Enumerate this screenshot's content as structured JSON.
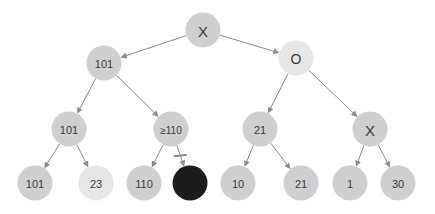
{
  "diagram": {
    "type": "game-tree",
    "edge_color": "#8a8a8a",
    "colors": {
      "default": "#cfcfcf",
      "light": "#e6e6e6",
      "pruned": "#1c1c1c"
    },
    "nodes": [
      {
        "id": "root",
        "label": "X",
        "x": 203,
        "y": 30,
        "fill": "default",
        "fs": 15
      },
      {
        "id": "n1",
        "label": "101",
        "x": 104,
        "y": 63,
        "fill": "default",
        "fs": 11
      },
      {
        "id": "n2",
        "label": "O",
        "x": 296,
        "y": 58,
        "fill": "light",
        "fs": 14
      },
      {
        "id": "n3",
        "label": "101",
        "x": 69,
        "y": 129,
        "fill": "default",
        "fs": 11
      },
      {
        "id": "n4",
        "label": "≥110",
        "x": 171,
        "y": 129,
        "fill": "default",
        "fs": 10
      },
      {
        "id": "n5",
        "label": "21",
        "x": 260,
        "y": 129,
        "fill": "default",
        "fs": 11
      },
      {
        "id": "n6",
        "label": "X",
        "x": 370,
        "y": 129,
        "fill": "default",
        "fs": 15
      },
      {
        "id": "n7",
        "label": "101",
        "x": 35,
        "y": 183,
        "fill": "default",
        "fs": 11
      },
      {
        "id": "n8",
        "label": "23",
        "x": 96,
        "y": 183,
        "fill": "light",
        "fs": 11
      },
      {
        "id": "n9",
        "label": "110",
        "x": 144,
        "y": 183,
        "fill": "default",
        "fs": 11
      },
      {
        "id": "n10",
        "label": "",
        "x": 190,
        "y": 183,
        "fill": "pruned",
        "fs": 11
      },
      {
        "id": "n11",
        "label": "10",
        "x": 238,
        "y": 183,
        "fill": "default",
        "fs": 11
      },
      {
        "id": "n12",
        "label": "21",
        "x": 301,
        "y": 183,
        "fill": "default",
        "fs": 11
      },
      {
        "id": "n13",
        "label": "1",
        "x": 350,
        "y": 183,
        "fill": "default",
        "fs": 11
      },
      {
        "id": "n14",
        "label": "30",
        "x": 398,
        "y": 183,
        "fill": "default",
        "fs": 11
      }
    ],
    "edges": [
      {
        "from": "root",
        "to": "n1",
        "pruned": false
      },
      {
        "from": "root",
        "to": "n2",
        "pruned": false
      },
      {
        "from": "n1",
        "to": "n3",
        "pruned": false
      },
      {
        "from": "n1",
        "to": "n4",
        "pruned": false
      },
      {
        "from": "n2",
        "to": "n5",
        "pruned": false
      },
      {
        "from": "n2",
        "to": "n6",
        "pruned": false
      },
      {
        "from": "n3",
        "to": "n7",
        "pruned": false
      },
      {
        "from": "n3",
        "to": "n8",
        "pruned": false
      },
      {
        "from": "n4",
        "to": "n9",
        "pruned": false
      },
      {
        "from": "n4",
        "to": "n10",
        "pruned": true
      },
      {
        "from": "n5",
        "to": "n11",
        "pruned": false
      },
      {
        "from": "n5",
        "to": "n12",
        "pruned": false
      },
      {
        "from": "n6",
        "to": "n13",
        "pruned": false
      },
      {
        "from": "n6",
        "to": "n14",
        "pruned": false
      }
    ]
  }
}
